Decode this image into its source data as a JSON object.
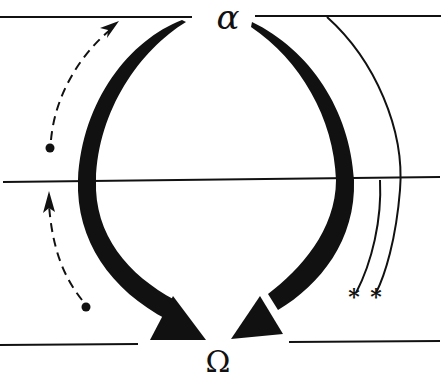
{
  "diagram": {
    "top_label": "α",
    "bottom_label": "Ω",
    "marker_symbol": "*",
    "colors": {
      "ink": "#111111",
      "background": "#ffffff"
    },
    "elements": {
      "levels": [
        "top-level-line",
        "middle-level-line",
        "bottom-level-line"
      ],
      "major_arrows": [
        "left-curved-arrow",
        "right-curved-arrow"
      ],
      "dashed_arrows": [
        "upper-dashed-arrow",
        "lower-dashed-arrow"
      ],
      "terminated_paths": [
        "outer-starred-path",
        "inner-starred-path"
      ]
    }
  }
}
